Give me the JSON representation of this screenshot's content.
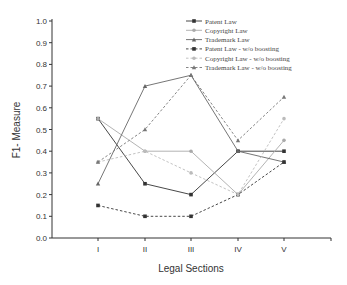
{
  "chart_data": {
    "type": "line",
    "title": "",
    "xlabel": "Legal Sections",
    "ylabel": "F1- Measure",
    "categories": [
      "I",
      "II",
      "III",
      "IV",
      "V"
    ],
    "ylim": [
      0.0,
      1.0
    ],
    "yticks": [
      "0.0",
      "0.1",
      "0.2",
      "0.3",
      "0.4",
      "0.5",
      "0.6",
      "0.7",
      "0.8",
      "0.9",
      "1.0"
    ],
    "grid": false,
    "legend_position": "top-right",
    "series": [
      {
        "name": "Patent Law",
        "values": [
          0.55,
          0.25,
          0.2,
          0.4,
          0.4
        ],
        "color": "#333333",
        "dash": "solid",
        "marker": "square"
      },
      {
        "name": "Copyright Law",
        "values": [
          0.55,
          0.4,
          0.4,
          0.2,
          0.45
        ],
        "color": "#aaaaaa",
        "dash": "solid",
        "marker": "circle"
      },
      {
        "name": "Trademark Law",
        "values": [
          0.25,
          0.7,
          0.75,
          0.4,
          0.35
        ],
        "color": "#666666",
        "dash": "solid",
        "marker": "triangle"
      },
      {
        "name": "Patent Law - w/o boosting",
        "values": [
          0.15,
          0.1,
          0.1,
          0.2,
          0.35
        ],
        "color": "#333333",
        "dash": "dashed",
        "marker": "square"
      },
      {
        "name": "Copyright Law - w/o boosting",
        "values": [
          0.35,
          0.4,
          0.3,
          0.2,
          0.55
        ],
        "color": "#bbbbbb",
        "dash": "dashed",
        "marker": "circle"
      },
      {
        "name": "Trademark Law - w/o boosting",
        "values": [
          0.35,
          0.5,
          0.75,
          0.45,
          0.65
        ],
        "color": "#777777",
        "dash": "dashed",
        "marker": "triangle"
      }
    ]
  }
}
